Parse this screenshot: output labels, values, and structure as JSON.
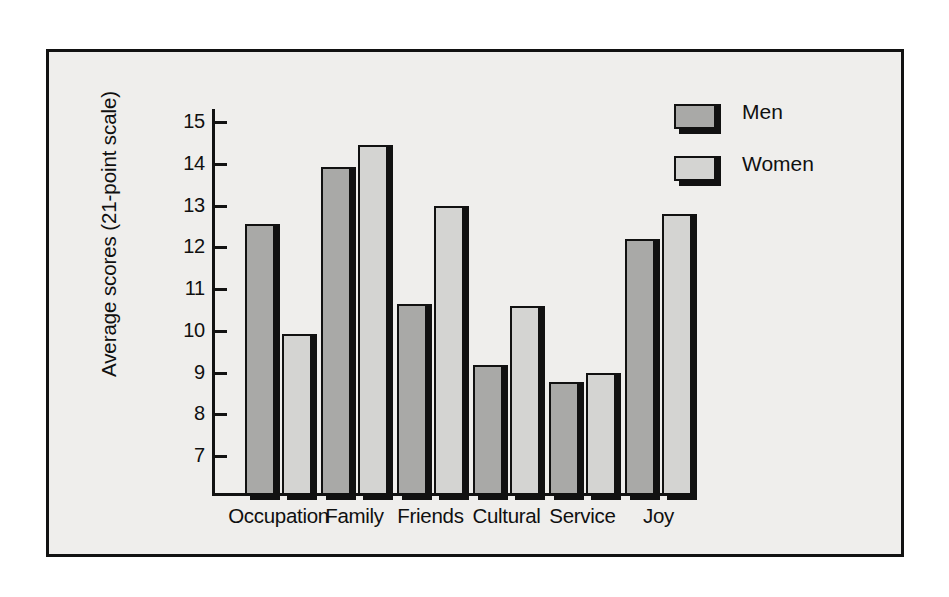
{
  "chart_data": {
    "type": "bar",
    "title": "",
    "xlabel": "",
    "ylabel": "Average scores (21-point scale)",
    "ylim": [
      7,
      15
    ],
    "yticks": [
      7,
      8,
      9,
      10,
      11,
      12,
      13,
      14,
      15
    ],
    "ytick_labels": [
      "7",
      "8",
      "9",
      "10",
      "11",
      "12",
      "13",
      "14",
      "15"
    ],
    "grid": false,
    "legend_position": "top-right",
    "categories": [
      "Occupation",
      "Family",
      "Friends",
      "Cultural",
      "Service",
      "Joy"
    ],
    "series": [
      {
        "name": "Men",
        "color": "#a9a9a7",
        "values": [
          12.55,
          13.92,
          10.65,
          9.18,
          8.78,
          12.2
        ]
      },
      {
        "name": "Women",
        "color": "#d4d4d2",
        "values": [
          9.92,
          14.45,
          13.0,
          10.6,
          9.0,
          12.8
        ]
      }
    ]
  },
  "legend": {
    "entries": [
      {
        "label": "Men",
        "swatch": "men"
      },
      {
        "label": "Women",
        "swatch": "women"
      }
    ]
  },
  "colors": {
    "men_fill": "#a9a9a7",
    "women_fill": "#d4d4d2",
    "outline": "#111111",
    "panel_background": "#efeeec",
    "page_background": "#ffffff"
  }
}
